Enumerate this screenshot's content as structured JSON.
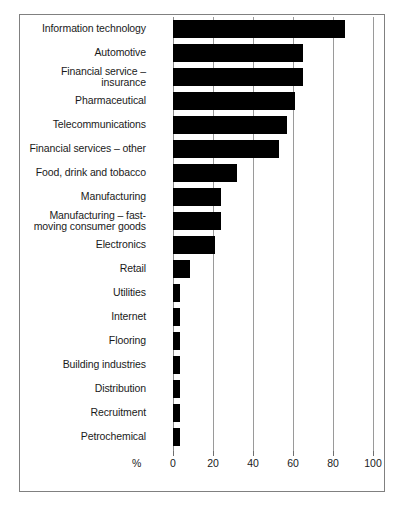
{
  "chart_data": {
    "type": "bar",
    "orientation": "horizontal",
    "title": "",
    "subtitle": "",
    "xlabel": "%",
    "ylabel": "",
    "xlim": [
      0,
      100
    ],
    "ylim": null,
    "grid": true,
    "legend": null,
    "legend_position": "none",
    "bar_color": "#000000",
    "categories": [
      "Information technology",
      "Automotive",
      "Financial service – insurance",
      "Pharmaceutical",
      "Telecommunications",
      "Financial services – other",
      "Food, drink and tobacco",
      "Manufacturing",
      "Manufacturing – fast-moving consumer goods",
      "Electronics",
      "Retail",
      "Utilities",
      "Internet",
      "Flooring",
      "Building industries",
      "Distribution",
      "Recruitment",
      "Petrochemical"
    ],
    "values": [
      86,
      65,
      65,
      61,
      57,
      53,
      32,
      24,
      24,
      21,
      8.5,
      3.5,
      3.5,
      3.5,
      3.5,
      3.5,
      3.5,
      3.5
    ],
    "xticks": [
      0,
      20,
      40,
      60,
      80,
      100
    ],
    "xtick_labels": [
      "0",
      "20",
      "40",
      "60",
      "80",
      "100"
    ]
  },
  "labels": {
    "lines": [
      [
        "Information technology"
      ],
      [
        "Automotive"
      ],
      [
        "Financial service –",
        "insurance"
      ],
      [
        "Pharmaceutical"
      ],
      [
        "Telecommunications"
      ],
      [
        "Financial services – other"
      ],
      [
        "Food, drink and tobacco"
      ],
      [
        "Manufacturing"
      ],
      [
        "Manufacturing – fast-",
        "moving consumer goods"
      ],
      [
        "Electronics"
      ],
      [
        "Retail"
      ],
      [
        "Utilities"
      ],
      [
        "Internet"
      ],
      [
        "Flooring"
      ],
      [
        "Building industries"
      ],
      [
        "Distribution"
      ],
      [
        "Recruitment"
      ],
      [
        "Petrochemical"
      ]
    ]
  },
  "axis": {
    "unit_symbol": "%"
  }
}
